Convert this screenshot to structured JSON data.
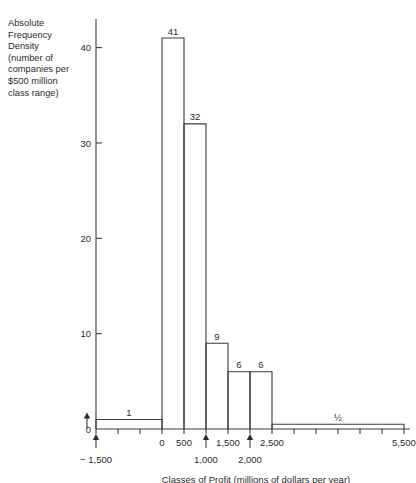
{
  "chart_data": {
    "type": "bar",
    "title": "",
    "subtitle": "",
    "xlabel": "Classes of Profit (millions of dollars per year)",
    "ylabel": "Absolute Frequency Density (number of companies per $500 million class range)",
    "ylabel_lines": [
      "Absolute",
      "Frequency",
      "Density",
      "(number of",
      "companies per",
      "$500 million",
      "class range)"
    ],
    "xlim": [
      -1500,
      5500
    ],
    "ylim": [
      0,
      43
    ],
    "grid": false,
    "legend": "none",
    "y_ticks": [
      0,
      10,
      20,
      30,
      40
    ],
    "y_tick_labels": [
      "0",
      "10",
      "20",
      "30",
      "40"
    ],
    "y_arrow_marker": 1,
    "x_minor_tick_step": 500,
    "x_tick_values": [
      -1500,
      -1000,
      -500,
      0,
      500,
      1000,
      1500,
      2000,
      2500,
      3000,
      3500,
      4000,
      4500,
      5000,
      5500
    ],
    "x_inline_labels": [
      {
        "value": 0,
        "text": "0"
      },
      {
        "value": 500,
        "text": "500"
      },
      {
        "value": 1500,
        "text": "1,500"
      },
      {
        "value": 2500,
        "text": "2,500"
      },
      {
        "value": 5500,
        "text": "5,500"
      }
    ],
    "x_arrow_labels": [
      {
        "value": -1500,
        "text": "− 1,500"
      },
      {
        "value": 1000,
        "text": "1,000"
      },
      {
        "value": 2000,
        "text": "2,000"
      }
    ],
    "bins": [
      {
        "start": -1500,
        "end": 0,
        "value": 1,
        "label": "1"
      },
      {
        "start": 0,
        "end": 500,
        "value": 41,
        "label": "41"
      },
      {
        "start": 500,
        "end": 1000,
        "value": 32,
        "label": "32"
      },
      {
        "start": 1000,
        "end": 1500,
        "value": 9,
        "label": "9"
      },
      {
        "start": 1500,
        "end": 2000,
        "value": 6,
        "label": "6"
      },
      {
        "start": 2000,
        "end": 2500,
        "value": 6,
        "label": "6"
      },
      {
        "start": 2500,
        "end": 5500,
        "value": 0.5,
        "label": "½"
      }
    ],
    "categories": [
      "-1500 to 0",
      "0 to 500",
      "500 to 1000",
      "1000 to 1500",
      "1500 to 2000",
      "2000 to 2500",
      "2500 to 5500"
    ],
    "values": [
      1,
      41,
      32,
      9,
      6,
      6,
      0.5
    ],
    "colors": {
      "stroke": "#3b3b3b",
      "fill": "none",
      "text": "#2a2a2a",
      "background": "#ffffff"
    }
  }
}
